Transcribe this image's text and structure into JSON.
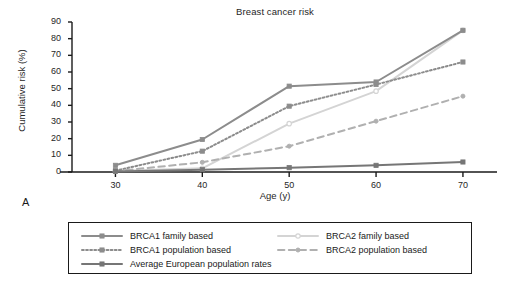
{
  "figure": {
    "panel_label": "A"
  },
  "chart_data": {
    "type": "line",
    "title": "Breast cancer risk",
    "xlabel": "Age (y)",
    "ylabel": "Cumulative risk (%)",
    "x": [
      30,
      40,
      50,
      60,
      70
    ],
    "xticks": [
      "30",
      "40",
      "50",
      "60",
      "70"
    ],
    "yticks": [
      "0",
      "10",
      "20",
      "30",
      "40",
      "50",
      "60",
      "70",
      "80",
      "90"
    ],
    "xlim": [
      25,
      73
    ],
    "ylim": [
      0,
      90
    ],
    "grid": false,
    "legend_position": "bottom",
    "series": [
      {
        "name": "BRCA1 family based",
        "values": [
          4,
          19.5,
          51.5,
          54,
          85
        ],
        "color": "#8c8c8c",
        "dash": "none",
        "marker": "square-filled",
        "width": 2
      },
      {
        "name": "BRCA1 population based",
        "values": [
          0.8,
          12.5,
          39.5,
          52.5,
          66
        ],
        "color": "#8c8c8c",
        "dash": "dotted",
        "marker": "square-filled",
        "width": 2
      },
      {
        "name": "Average European population rates",
        "values": [
          0.3,
          1.4,
          2.6,
          4,
          6
        ],
        "color": "#767676",
        "dash": "none",
        "marker": "square-filled",
        "width": 2
      },
      {
        "name": "BRCA2 family based",
        "values": [
          0.6,
          2.2,
          29,
          48.5,
          85
        ],
        "color": "#d4d4d4",
        "dash": "none",
        "marker": "circle-open",
        "width": 2
      },
      {
        "name": "BRCA2 population based",
        "values": [
          0.5,
          5.8,
          15.5,
          30.5,
          45.5
        ],
        "color": "#b0b0b0",
        "dash": "dashed",
        "marker": "circle-filled",
        "width": 2
      }
    ]
  }
}
